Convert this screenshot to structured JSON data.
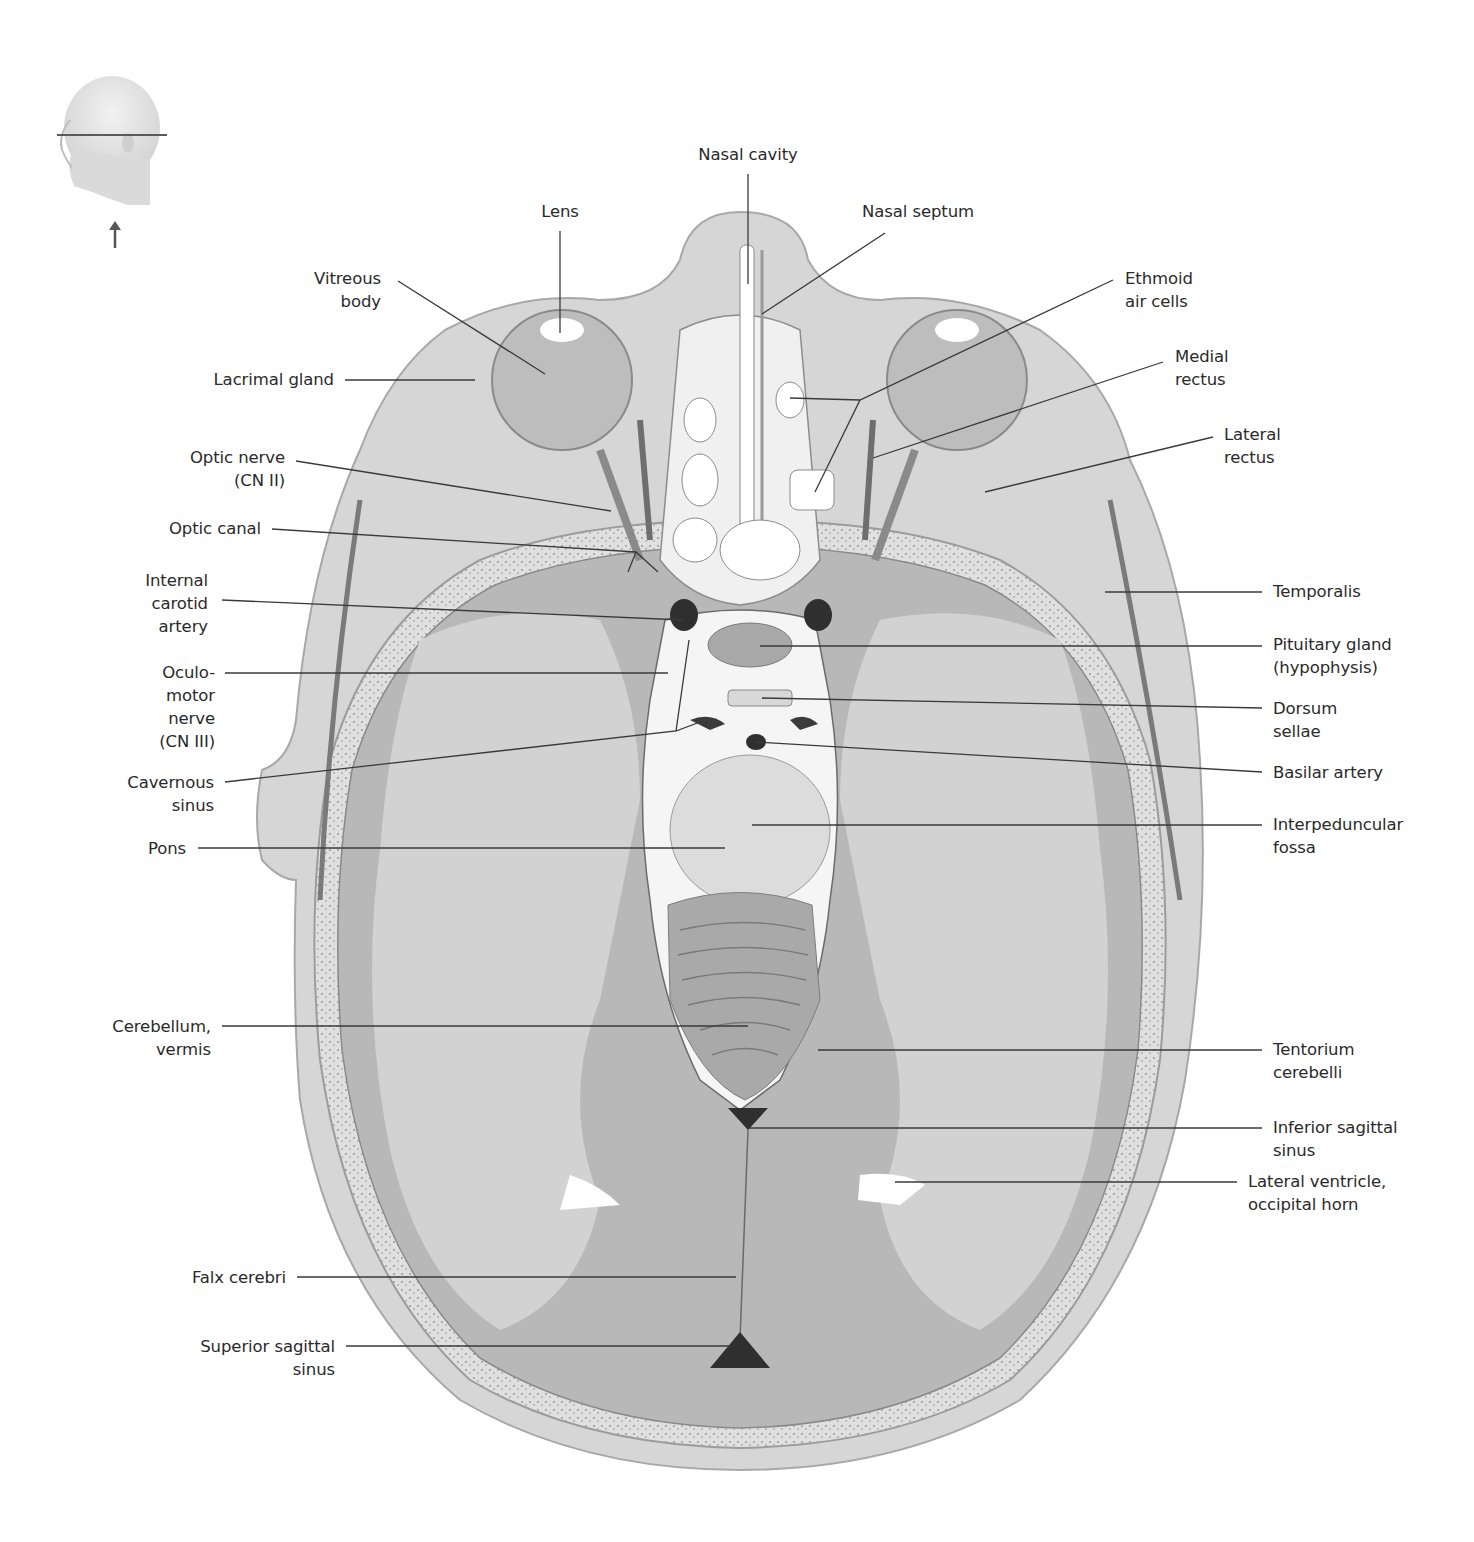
{
  "figure": {
    "type": "anatomical-illustration",
    "view": "Transverse (axial) section of head at level of orbits",
    "orientation_icon": {
      "name": "head-orientation-icon",
      "description": "Lateral head with horizontal section plane line and upward arrow (viewed from below)"
    },
    "colors": {
      "background": "#ffffff",
      "label_text": "#2a2a2a",
      "leader_line": "#3a3a3a",
      "skin": "#d4d4d4",
      "bone": "#e6e6e6",
      "gray_matter": "#b3b3b3",
      "white_matter": "#d0d0d0",
      "csf_vessel_dark": "#3b3b3b",
      "eye_globe": "#bdbdbd",
      "marrow_texture": "#9a9a9a"
    }
  },
  "labels": [
    {
      "id": "nasal-cavity",
      "text": "Nasal cavity",
      "x": 748,
      "y": 143,
      "align": "c",
      "line": [
        [
          748,
          174
        ],
        [
          748,
          284
        ]
      ]
    },
    {
      "id": "lens",
      "text": "Lens",
      "x": 560,
      "y": 200,
      "align": "c",
      "line": [
        [
          560,
          231
        ],
        [
          560,
          333
        ]
      ]
    },
    {
      "id": "nasal-septum",
      "text": "Nasal septum",
      "x": 862,
      "y": 200,
      "align": "l",
      "line": [
        [
          885,
          233
        ],
        [
          762,
          314
        ]
      ]
    },
    {
      "id": "vitreous-body",
      "text": "Vitreous\nbody",
      "x": 381,
      "y": 267,
      "align": "r",
      "line": [
        [
          398,
          281
        ],
        [
          545,
          374
        ]
      ]
    },
    {
      "id": "ethmoid-air-cells",
      "text": "Ethmoid\nair cells",
      "x": 1125,
      "y": 267,
      "align": "l",
      "line": [
        [
          1113,
          280
        ],
        [
          860,
          400
        ],
        [
          790,
          398
        ],
        [
          860,
          400
        ],
        [
          815,
          492
        ]
      ]
    },
    {
      "id": "lacrimal-gland",
      "text": "Lacrimal gland",
      "x": 334,
      "y": 368,
      "align": "r",
      "line": [
        [
          345,
          380
        ],
        [
          475,
          380
        ]
      ]
    },
    {
      "id": "medial-rectus",
      "text": "Medial\nrectus",
      "x": 1175,
      "y": 345,
      "align": "l",
      "line": [
        [
          1163,
          362
        ],
        [
          873,
          458
        ]
      ]
    },
    {
      "id": "lateral-rectus",
      "text": "Lateral\nrectus",
      "x": 1224,
      "y": 423,
      "align": "l",
      "line": [
        [
          1213,
          437
        ],
        [
          985,
          492
        ]
      ]
    },
    {
      "id": "optic-nerve",
      "text": "Optic nerve\n(CN II)",
      "x": 285,
      "y": 446,
      "align": "r",
      "line": [
        [
          296,
          461
        ],
        [
          611,
          511
        ]
      ]
    },
    {
      "id": "optic-canal",
      "text": "Optic canal",
      "x": 261,
      "y": 517,
      "align": "r",
      "line": [
        [
          272,
          529
        ],
        [
          636,
          552
        ],
        [
          658,
          572
        ],
        [
          636,
          552
        ],
        [
          628,
          572
        ]
      ]
    },
    {
      "id": "internal-carotid-artery",
      "text": "Internal\ncarotid\nartery",
      "x": 208,
      "y": 569,
      "align": "r",
      "line": [
        [
          222,
          600
        ],
        [
          683,
          620
        ]
      ]
    },
    {
      "id": "temporalis",
      "text": "Temporalis",
      "x": 1273,
      "y": 580,
      "align": "l",
      "line": [
        [
          1262,
          592
        ],
        [
          1105,
          592
        ]
      ]
    },
    {
      "id": "pituitary-gland",
      "text": "Pituitary gland\n(hypophysis)",
      "x": 1273,
      "y": 633,
      "align": "l",
      "line": [
        [
          1262,
          646
        ],
        [
          760,
          646
        ]
      ]
    },
    {
      "id": "oculomotor-nerve",
      "text": "Oculo-\nmotor\nnerve\n(CN III)",
      "x": 215,
      "y": 661,
      "align": "r",
      "line": [
        [
          225,
          673
        ],
        [
          668,
          673
        ]
      ]
    },
    {
      "id": "dorsum-sellae",
      "text": "Dorsum\nsellae",
      "x": 1273,
      "y": 697,
      "align": "l",
      "line": [
        [
          1262,
          708
        ],
        [
          762,
          698
        ]
      ]
    },
    {
      "id": "basilar-artery",
      "text": "Basilar artery",
      "x": 1273,
      "y": 761,
      "align": "l",
      "line": [
        [
          1262,
          772
        ],
        [
          756,
          742
        ]
      ]
    },
    {
      "id": "cavernous-sinus",
      "text": "Cavernous\nsinus",
      "x": 214,
      "y": 771,
      "align": "r",
      "line": [
        [
          225,
          782
        ],
        [
          676,
          731
        ],
        [
          689,
          640
        ],
        [
          676,
          731
        ],
        [
          700,
          722
        ]
      ]
    },
    {
      "id": "interpeduncular-fossa",
      "text": "Interpeduncular\nfossa",
      "x": 1273,
      "y": 813,
      "align": "l",
      "line": [
        [
          1262,
          825
        ],
        [
          752,
          825
        ]
      ]
    },
    {
      "id": "pons",
      "text": "Pons",
      "x": 186,
      "y": 837,
      "align": "r",
      "line": [
        [
          198,
          848
        ],
        [
          725,
          848
        ]
      ]
    },
    {
      "id": "cerebellum-vermis",
      "text": "Cerebellum,\nvermis",
      "x": 211,
      "y": 1015,
      "align": "r",
      "line": [
        [
          222,
          1026
        ],
        [
          748,
          1026
        ]
      ]
    },
    {
      "id": "tentorium-cerebelli",
      "text": "Tentorium\ncerebelli",
      "x": 1273,
      "y": 1038,
      "align": "l",
      "line": [
        [
          1262,
          1050
        ],
        [
          818,
          1050
        ]
      ]
    },
    {
      "id": "inferior-sagittal-sinus",
      "text": "Inferior sagittal\nsinus",
      "x": 1273,
      "y": 1116,
      "align": "l",
      "line": [
        [
          1262,
          1128
        ],
        [
          749,
          1128
        ]
      ]
    },
    {
      "id": "lateral-ventricle-occipital-horn",
      "text": "Lateral ventricle,\noccipital horn",
      "x": 1248,
      "y": 1170,
      "align": "l",
      "line": [
        [
          1237,
          1182
        ],
        [
          895,
          1182
        ]
      ]
    },
    {
      "id": "falx-cerebri",
      "text": "Falx cerebri",
      "x": 286,
      "y": 1266,
      "align": "r",
      "line": [
        [
          297,
          1277
        ],
        [
          736,
          1277
        ]
      ]
    },
    {
      "id": "superior-sagittal-sinus",
      "text": "Superior sagittal\nsinus",
      "x": 335,
      "y": 1335,
      "align": "r",
      "line": [
        [
          346,
          1346
        ],
        [
          731,
          1346
        ]
      ]
    }
  ]
}
